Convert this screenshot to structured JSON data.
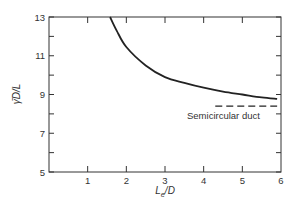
{
  "chart_data": {
    "type": "line",
    "title": "",
    "xlabel": "L_e/D",
    "ylabel": "γ̄D/L",
    "xlim": [
      0,
      6
    ],
    "ylim": [
      5,
      13
    ],
    "x_ticks": [
      "1",
      "2",
      "3",
      "4",
      "5",
      "6"
    ],
    "y_ticks": [
      "5",
      "7",
      "9",
      "11",
      "13"
    ],
    "grid": false,
    "series": [
      {
        "name": "curve",
        "style": "solid",
        "x": [
          1.58,
          1.75,
          2.0,
          2.5,
          3.0,
          3.5,
          4.0,
          4.5,
          5.0,
          5.5,
          5.9
        ],
        "y": [
          13.0,
          12.3,
          11.45,
          10.5,
          9.9,
          9.6,
          9.35,
          9.15,
          9.0,
          8.85,
          8.77
        ]
      },
      {
        "name": "Semicircular duct",
        "style": "dashed",
        "x": [
          4.3,
          5.9
        ],
        "y": [
          8.4,
          8.4
        ]
      }
    ],
    "annotations": [
      {
        "text": "Semicircular duct",
        "x": 5.1,
        "y": 7.9
      }
    ]
  }
}
